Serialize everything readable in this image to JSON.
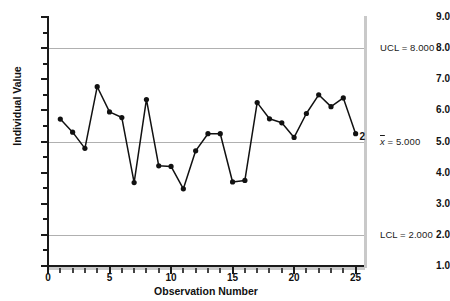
{
  "chart_data": {
    "type": "line",
    "title": "",
    "xlabel": "Observation Number",
    "ylabel": "Individual Value",
    "xlim": [
      0,
      25.6
    ],
    "ylim": [
      1.0,
      9.0
    ],
    "grid": true,
    "x": [
      1,
      2,
      3,
      4,
      5,
      6,
      7,
      8,
      9,
      10,
      11,
      12,
      13,
      14,
      15,
      16,
      17,
      18,
      19,
      20,
      21,
      22,
      23,
      24,
      25
    ],
    "values": [
      5.72,
      5.3,
      4.78,
      6.76,
      5.95,
      5.77,
      3.68,
      6.35,
      4.22,
      4.2,
      3.48,
      4.7,
      5.25,
      5.25,
      3.7,
      3.75,
      6.25,
      5.73,
      5.6,
      5.13,
      5.9,
      6.5,
      6.12,
      6.4,
      5.25
    ],
    "y_ticks": [
      "1.0",
      "2.0",
      "3.0",
      "4.0",
      "5.0",
      "6.0",
      "7.0",
      "8.0",
      "9.0"
    ],
    "y_tick_values": [
      1.0,
      2.0,
      3.0,
      4.0,
      5.0,
      6.0,
      7.0,
      8.0,
      9.0
    ],
    "x_ticks": [
      "0",
      "5",
      "10",
      "15",
      "20",
      "25"
    ],
    "x_tick_values": [
      0,
      5,
      10,
      15,
      20,
      25
    ],
    "control_limits": [
      {
        "name": "UCL",
        "label": "UCL = 8.000",
        "value": 8.0
      },
      {
        "name": "center",
        "label": "x̄ = 5.000",
        "value": 5.0
      },
      {
        "name": "LCL",
        "label": "LCL = 2.000",
        "value": 2.0
      }
    ],
    "annotations": [
      {
        "text": "2",
        "x": 25,
        "y": 5.25,
        "note": "violation rule marker at last point"
      }
    ],
    "series_color": "#111111",
    "grid_color": "#b0b0b0",
    "axis_color": "#1a1a1a"
  },
  "labels": {
    "y_axis_title": "Individual Value",
    "x_axis_title": "Observation Number",
    "ucl": "UCL = 8.000",
    "center_prefix": "x",
    "center_suffix": " = 5.000",
    "center_full": "x̄ = 5.000",
    "lcl": "LCL = 2.000",
    "point_annotation": "2"
  }
}
